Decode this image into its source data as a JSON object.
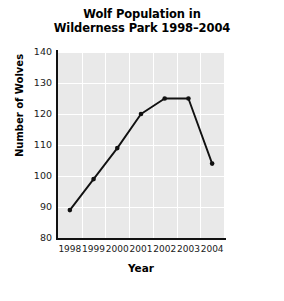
{
  "chart_data": {
    "type": "line",
    "title": "Wolf Population in Wilderness Park 1998–2004",
    "title_line1": "Wolf Population in",
    "title_line2": "Wilderness Park 1998–2004",
    "xlabel": "Year",
    "ylabel": "Number of Wolves",
    "categories": [
      "1998",
      "1999",
      "2000",
      "2001",
      "2002",
      "2003",
      "2004"
    ],
    "values": [
      89,
      99,
      109,
      120,
      125,
      125,
      104
    ],
    "series": [
      {
        "name": "Number of Wolves",
        "values": [
          89,
          99,
          109,
          120,
          125,
          125,
          104
        ]
      }
    ],
    "ylim": [
      80,
      140
    ],
    "yticks": [
      "80",
      "90",
      "100",
      "110",
      "120",
      "130",
      "140"
    ],
    "ytick_values": [
      80,
      90,
      100,
      110,
      120,
      130,
      140
    ],
    "xticks": [
      "1998",
      "1999",
      "2000",
      "2001",
      "2002",
      "2003",
      "2004"
    ],
    "grid": true,
    "grid_color": "#ffffff",
    "plot_background": "#e9e9e9",
    "line_color": "#111111",
    "marker": "circle",
    "marker_color": "#111111",
    "legend": null,
    "legend_position": "none"
  }
}
